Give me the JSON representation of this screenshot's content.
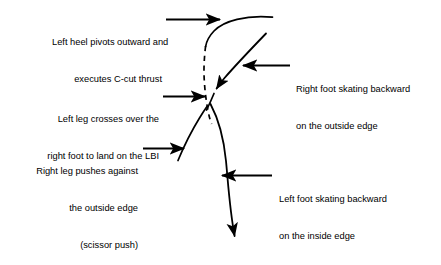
{
  "figure": {
    "background_color": "#ffffff",
    "stroke_color": "#000000"
  },
  "annotations": [
    {
      "id": "left-heel-pivot",
      "name": "annotation-left-heel-pivot",
      "align": "right",
      "lines": [
        "Left heel pivots outward and",
        "executes C-cut thrust"
      ],
      "pointer": "arrow-right"
    },
    {
      "id": "left-leg-crosses",
      "name": "annotation-left-leg-crosses",
      "align": "right",
      "lines": [
        "Left leg crosses over the",
        "right foot to land on the LBI"
      ],
      "pointer": "arrow-right"
    },
    {
      "id": "right-leg-pushes",
      "name": "annotation-right-leg-pushes",
      "align": "right",
      "lines": [
        "Right leg pushes against",
        "the outside edge",
        "(scissor push)"
      ],
      "pointer": "arrow-right"
    },
    {
      "id": "right-foot-backward",
      "name": "annotation-right-foot-backward",
      "align": "left",
      "lines": [
        "Right foot skating backward",
        "on the outside edge"
      ],
      "pointer": "arrow-left"
    },
    {
      "id": "left-foot-backward",
      "name": "annotation-left-foot-backward",
      "align": "left",
      "lines": [
        "Left foot skating backward",
        "on the inside edge"
      ],
      "pointer": "arrow-left"
    }
  ],
  "tracings": [
    {
      "id": "right-foot-outside-edge-entry",
      "name": "trace-right-foot-outside-edge",
      "style": "solid",
      "description": "Upper arc of the right foot travelling backward on the outside edge"
    },
    {
      "id": "left-heel-c-cut",
      "name": "trace-left-heel-c-cut",
      "style": "dashed",
      "description": "Dashed free-leg path of the left heel pivoting outward into the C-cut thrust"
    },
    {
      "id": "crossing-stroke",
      "name": "trace-crossing-stroke",
      "style": "solid",
      "description": "Diagonal stroke descending to the crossing point, arrowhead mid-path"
    },
    {
      "id": "left-foot-inside-edge",
      "name": "trace-left-foot-inside-edge",
      "style": "solid",
      "description": "Long curve of the left foot skating backward on the inside edge, arrowhead at the end"
    },
    {
      "id": "right-leg-push-edge",
      "name": "trace-right-leg-push-edge",
      "style": "solid",
      "description": "Lower left curve of the right leg pushing against the outside edge"
    }
  ]
}
